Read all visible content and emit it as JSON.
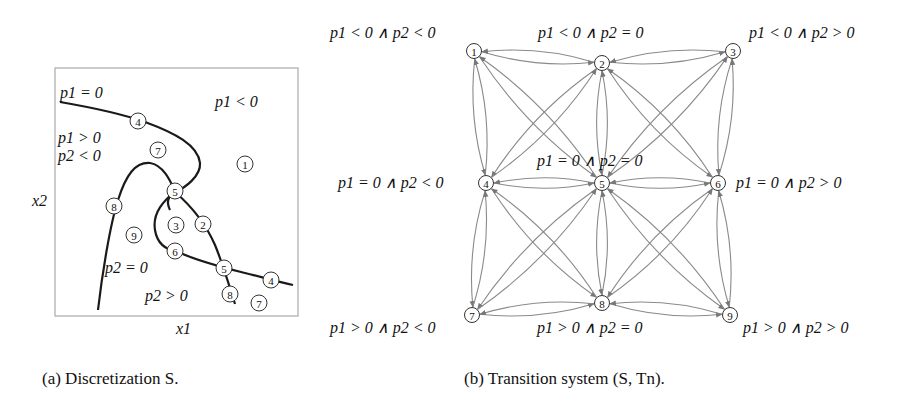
{
  "panel_a": {
    "caption": "(a) Discretization S.",
    "x_label": "x1",
    "y_label": "x2",
    "region_labels": {
      "p1_eq_0": "p1 = 0",
      "p1_lt_0": "p1 < 0",
      "p1_gt_0": "p1 > 0",
      "p2_lt_0": "p2 < 0",
      "p2_eq_0": "p2 = 0",
      "p2_gt_0": "p2 > 0"
    },
    "markers": [
      {
        "id": "4",
        "x": 138,
        "y": 121
      },
      {
        "id": "7",
        "x": 158,
        "y": 150
      },
      {
        "id": "1",
        "x": 245,
        "y": 164
      },
      {
        "id": "5",
        "x": 175,
        "y": 191
      },
      {
        "id": "8",
        "x": 114,
        "y": 206
      },
      {
        "id": "3",
        "x": 176,
        "y": 225
      },
      {
        "id": "2",
        "x": 203,
        "y": 224
      },
      {
        "id": "9",
        "x": 134,
        "y": 235
      },
      {
        "id": "6",
        "x": 175,
        "y": 251
      },
      {
        "id": "5",
        "x": 224,
        "y": 268
      },
      {
        "id": "4",
        "x": 271,
        "y": 280
      },
      {
        "id": "8",
        "x": 230,
        "y": 294
      },
      {
        "id": "7",
        "x": 259,
        "y": 303
      }
    ]
  },
  "panel_b": {
    "caption": "(b) Transition system (S, Tn).",
    "nodes": [
      {
        "id": "1",
        "x": 474,
        "y": 51,
        "label": "p1 < 0 ∧ p2 < 0"
      },
      {
        "id": "2",
        "x": 602,
        "y": 63,
        "label": "p1 < 0 ∧ p2 = 0"
      },
      {
        "id": "3",
        "x": 733,
        "y": 51,
        "label": "p1 < 0 ∧ p2 > 0"
      },
      {
        "id": "4",
        "x": 486,
        "y": 183,
        "label": "p1 = 0 ∧ p2 < 0"
      },
      {
        "id": "5",
        "x": 602,
        "y": 183,
        "label": "p1 = 0 ∧ p2 = 0"
      },
      {
        "id": "6",
        "x": 718,
        "y": 183,
        "label": "p1 = 0 ∧ p2 > 0"
      },
      {
        "id": "7",
        "x": 472,
        "y": 315,
        "label": "p1 > 0 ∧ p2 < 0"
      },
      {
        "id": "8",
        "x": 602,
        "y": 303,
        "label": "p1 > 0 ∧ p2 = 0"
      },
      {
        "id": "9",
        "x": 730,
        "y": 315,
        "label": "p1 > 0 ∧ p2 > 0"
      }
    ],
    "edges": [
      [
        "1",
        "2"
      ],
      [
        "2",
        "3"
      ],
      [
        "4",
        "5"
      ],
      [
        "5",
        "6"
      ],
      [
        "7",
        "8"
      ],
      [
        "8",
        "9"
      ],
      [
        "1",
        "4"
      ],
      [
        "4",
        "7"
      ],
      [
        "2",
        "5"
      ],
      [
        "5",
        "8"
      ],
      [
        "3",
        "6"
      ],
      [
        "6",
        "9"
      ],
      [
        "1",
        "5"
      ],
      [
        "2",
        "4"
      ],
      [
        "2",
        "6"
      ],
      [
        "3",
        "5"
      ],
      [
        "4",
        "8"
      ],
      [
        "5",
        "7"
      ],
      [
        "5",
        "9"
      ],
      [
        "6",
        "8"
      ]
    ]
  }
}
